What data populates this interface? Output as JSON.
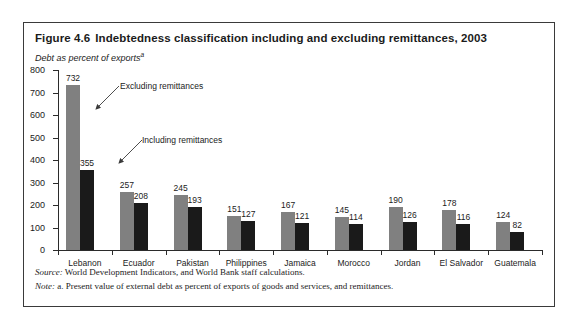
{
  "figure": {
    "number": "Figure 4.6",
    "title": "Indebtedness classification including and excluding remittances, 2003",
    "subtitle": "Debt as percent of exports",
    "subtitle_superscript": "a"
  },
  "annotations": {
    "excluding": "Excluding remittances",
    "including": "Including remittances"
  },
  "footnotes": {
    "source_label": "Source:",
    "source_text": "World Development Indicators, and World Bank staff calculations.",
    "note_label": "Note:",
    "note_text": "a. Present value of external debt as percent of exports of goods and services, and remittances."
  },
  "colors": {
    "excluding_bar": "#808080",
    "including_bar": "#1a1a1a",
    "axis": "#2b2b2b",
    "frame": "#3a3a3a",
    "text": "#1b1b1b"
  },
  "chart_data": {
    "type": "bar",
    "title": "Indebtedness classification including and excluding remittances, 2003",
    "xlabel": "",
    "ylabel": "Debt as percent of exports",
    "ylim": [
      0,
      800
    ],
    "yticks": [
      0,
      100,
      200,
      300,
      400,
      500,
      600,
      700,
      800
    ],
    "grid": false,
    "legend_position": "annotations-inline",
    "categories": [
      "Lebanon",
      "Ecuador",
      "Pakistan",
      "Philippines",
      "Jamaica",
      "Morocco",
      "Jordan",
      "El Salvador",
      "Guatemala"
    ],
    "series": [
      {
        "name": "Excluding remittances",
        "color": "#808080",
        "values": [
          732,
          257,
          245,
          151,
          167,
          145,
          190,
          178,
          124
        ]
      },
      {
        "name": "Including remittances",
        "color": "#1a1a1a",
        "values": [
          355,
          208,
          193,
          127,
          121,
          114,
          126,
          116,
          82
        ]
      }
    ]
  }
}
